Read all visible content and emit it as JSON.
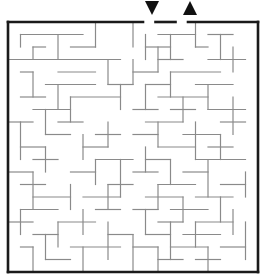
{
  "puzzle": {
    "type": "maze",
    "grid": {
      "cols": 20,
      "rows": 20,
      "origin_x": 8,
      "origin_y": 22,
      "cell_w": 12.5,
      "cell_h": 12.5
    },
    "colors": {
      "border": "#1a1a1a",
      "walls": "#8a8a8a",
      "arrows": "#111111",
      "background": "#ffffff"
    },
    "entrance": {
      "label": "start-arrow",
      "direction": "down",
      "col": 11
    },
    "exit": {
      "label": "end-arrow",
      "direction": "up",
      "col": 14
    },
    "walls_h": [
      [
        1,
        1,
        6
      ],
      [
        2,
        2,
        3
      ],
      [
        2,
        5,
        7
      ],
      [
        3,
        0,
        3
      ],
      [
        3,
        3,
        9
      ],
      [
        4,
        1,
        2
      ],
      [
        4,
        4,
        7
      ],
      [
        5,
        3,
        7
      ],
      [
        5,
        8,
        10
      ],
      [
        6,
        1,
        3
      ],
      [
        6,
        5,
        9
      ],
      [
        7,
        2,
        5
      ],
      [
        8,
        0,
        2
      ],
      [
        8,
        4,
        6
      ],
      [
        9,
        3,
        5
      ],
      [
        9,
        7,
        9
      ],
      [
        10,
        1,
        3
      ],
      [
        10,
        6,
        8
      ],
      [
        11,
        2,
        4
      ],
      [
        11,
        7,
        10
      ],
      [
        12,
        0,
        2
      ],
      [
        12,
        5,
        7
      ],
      [
        13,
        1,
        3
      ],
      [
        13,
        8,
        10
      ],
      [
        14,
        2,
        5
      ],
      [
        14,
        6,
        9
      ],
      [
        15,
        1,
        4
      ],
      [
        15,
        7,
        9
      ],
      [
        16,
        0,
        2
      ],
      [
        16,
        4,
        7
      ],
      [
        17,
        2,
        4
      ],
      [
        17,
        8,
        10
      ],
      [
        18,
        1,
        2
      ],
      [
        18,
        5,
        9
      ],
      [
        19,
        3,
        5
      ],
      [
        1,
        12,
        15
      ],
      [
        1,
        16,
        18
      ],
      [
        2,
        11,
        13
      ],
      [
        2,
        15,
        16
      ],
      [
        3,
        12,
        14
      ],
      [
        3,
        16,
        19
      ],
      [
        4,
        10,
        12
      ],
      [
        4,
        13,
        17
      ],
      [
        5,
        11,
        13
      ],
      [
        5,
        15,
        18
      ],
      [
        6,
        12,
        16
      ],
      [
        7,
        10,
        12
      ],
      [
        7,
        13,
        15
      ],
      [
        7,
        16,
        19
      ],
      [
        8,
        11,
        14
      ],
      [
        8,
        17,
        19
      ],
      [
        9,
        10,
        12
      ],
      [
        9,
        14,
        17
      ],
      [
        10,
        12,
        15
      ],
      [
        10,
        16,
        18
      ],
      [
        11,
        11,
        13
      ],
      [
        11,
        15,
        19
      ],
      [
        12,
        10,
        12
      ],
      [
        12,
        14,
        16
      ],
      [
        13,
        12,
        15
      ],
      [
        13,
        17,
        19
      ],
      [
        14,
        11,
        14
      ],
      [
        14,
        15,
        18
      ],
      [
        15,
        10,
        12
      ],
      [
        15,
        13,
        16
      ],
      [
        16,
        12,
        14
      ],
      [
        16,
        15,
        18
      ],
      [
        17,
        11,
        13
      ],
      [
        17,
        14,
        17
      ],
      [
        18,
        10,
        12
      ],
      [
        18,
        13,
        16
      ],
      [
        18,
        17,
        19
      ],
      [
        19,
        12,
        14
      ],
      [
        19,
        15,
        17
      ]
    ],
    "walls_v": [
      [
        1,
        1,
        2
      ],
      [
        2,
        2,
        3
      ],
      [
        4,
        1,
        3
      ],
      [
        7,
        0,
        2
      ],
      [
        2,
        4,
        6
      ],
      [
        4,
        5,
        7
      ],
      [
        3,
        7,
        9
      ],
      [
        5,
        6,
        8
      ],
      [
        1,
        8,
        11
      ],
      [
        6,
        9,
        11
      ],
      [
        3,
        10,
        12
      ],
      [
        7,
        11,
        13
      ],
      [
        2,
        12,
        15
      ],
      [
        5,
        13,
        15
      ],
      [
        1,
        15,
        17
      ],
      [
        4,
        16,
        18
      ],
      [
        6,
        15,
        17
      ],
      [
        8,
        16,
        19
      ],
      [
        2,
        18,
        20
      ],
      [
        6,
        18,
        20
      ],
      [
        3,
        17,
        19
      ],
      [
        8,
        3,
        5
      ],
      [
        9,
        5,
        7
      ],
      [
        8,
        8,
        10
      ],
      [
        9,
        11,
        14
      ],
      [
        8,
        13,
        15
      ],
      [
        10,
        0,
        2
      ],
      [
        10,
        3,
        5
      ],
      [
        11,
        1,
        3
      ],
      [
        12,
        2,
        4
      ],
      [
        13,
        1,
        3
      ],
      [
        15,
        0,
        2
      ],
      [
        17,
        1,
        3
      ],
      [
        18,
        2,
        4
      ],
      [
        11,
        5,
        7
      ],
      [
        13,
        4,
        6
      ],
      [
        14,
        6,
        8
      ],
      [
        16,
        5,
        7
      ],
      [
        18,
        6,
        9
      ],
      [
        12,
        8,
        10
      ],
      [
        15,
        8,
        11
      ],
      [
        17,
        9,
        11
      ],
      [
        11,
        10,
        12
      ],
      [
        13,
        11,
        13
      ],
      [
        16,
        11,
        14
      ],
      [
        19,
        12,
        14
      ],
      [
        12,
        13,
        15
      ],
      [
        14,
        14,
        16
      ],
      [
        17,
        14,
        16
      ],
      [
        11,
        15,
        17
      ],
      [
        13,
        16,
        19
      ],
      [
        15,
        16,
        18
      ],
      [
        18,
        15,
        17
      ],
      [
        10,
        17,
        20
      ],
      [
        12,
        18,
        20
      ],
      [
        16,
        18,
        20
      ],
      [
        19,
        16,
        19
      ]
    ]
  }
}
